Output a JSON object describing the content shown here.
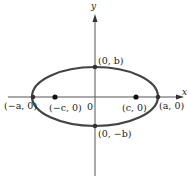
{
  "diagram": {
    "axes": {
      "x_label": "x",
      "y_label": "y",
      "origin_label": "0"
    },
    "points": {
      "vertex_left": "(−a, 0)",
      "vertex_right": "(a, 0)",
      "focus_left": "(−c, 0)",
      "focus_right": "(c, 0)",
      "covertex_top": "(0, b)",
      "covertex_bottom": "(0, −b)"
    },
    "colors": {
      "ellipse": "#444444",
      "axis": "#555555",
      "point": "#111111",
      "text": "#222222"
    }
  }
}
